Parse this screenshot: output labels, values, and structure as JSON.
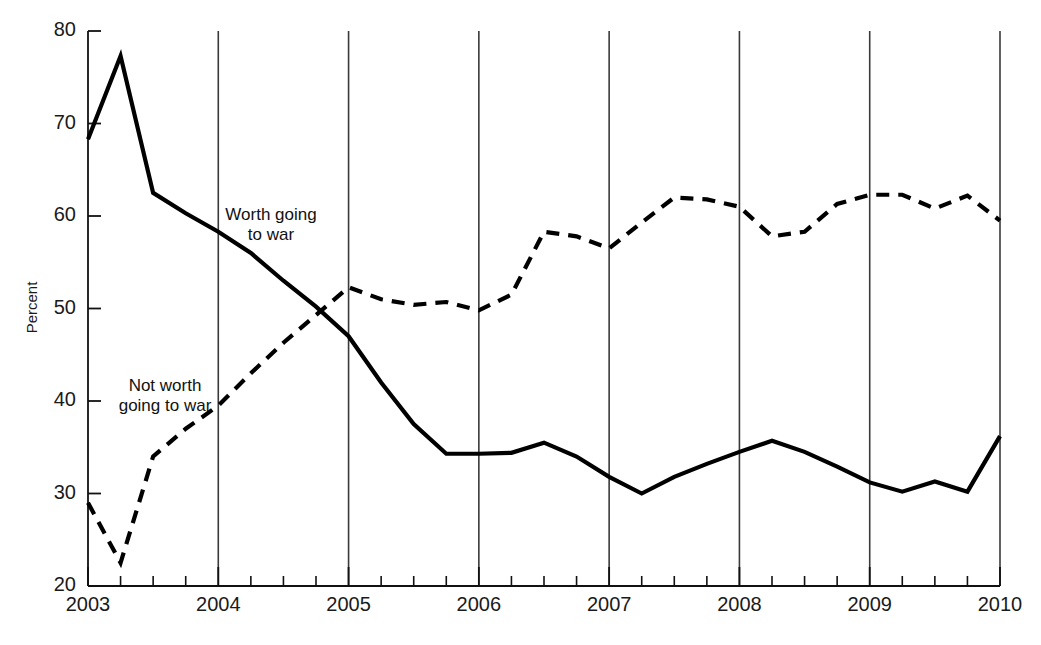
{
  "chart_data": {
    "type": "line",
    "title": "",
    "subtitle": "",
    "xlabel": "",
    "ylabel": "Percent",
    "ylim": [
      20,
      80
    ],
    "xlim": [
      2003,
      2010
    ],
    "y_ticks": [
      20,
      30,
      40,
      50,
      60,
      70,
      80
    ],
    "x_ticks": [
      2003,
      2004,
      2005,
      2006,
      2007,
      2008,
      2009,
      2010
    ],
    "x_tick_labels": [
      "2003",
      "2004",
      "2005",
      "2006",
      "2007",
      "2008",
      "2009",
      "2010"
    ],
    "y_tick_labels": [
      "20",
      "30",
      "40",
      "50",
      "60",
      "70",
      "80"
    ],
    "x_minor_ticks_per_interval": 4,
    "grid": "vertical-only",
    "legend_position": "inline-annotations",
    "series": [
      {
        "name": "Worth going to war",
        "style": "solid",
        "color": "#000000",
        "line_width": 4.2,
        "x": [
          2003.0,
          2003.25,
          2003.5,
          2003.75,
          2004.0,
          2004.25,
          2004.5,
          2004.75,
          2005.0,
          2005.25,
          2005.5,
          2005.75,
          2006.0,
          2006.25,
          2006.5,
          2006.75,
          2007.0,
          2007.25,
          2007.5,
          2007.75,
          2008.0,
          2008.25,
          2008.5,
          2008.75,
          2009.0,
          2009.25,
          2009.5,
          2009.75,
          2010.0
        ],
        "values": [
          68.3,
          77.3,
          62.5,
          60.3,
          58.3,
          56.0,
          53.0,
          50.2,
          47.0,
          42.0,
          37.5,
          34.3,
          34.3,
          34.4,
          35.5,
          34.0,
          31.8,
          30.0,
          31.8,
          33.2,
          34.5,
          35.7,
          34.5,
          32.9,
          31.2,
          30.2,
          31.3,
          30.2,
          36.2
        ]
      },
      {
        "name": "Not worth going to war",
        "style": "dashed",
        "color": "#000000",
        "line_width": 4.2,
        "x": [
          2003.0,
          2003.25,
          2003.5,
          2003.75,
          2004.0,
          2004.25,
          2004.5,
          2004.75,
          2005.0,
          2005.25,
          2005.5,
          2005.75,
          2006.0,
          2006.25,
          2006.5,
          2006.75,
          2007.0,
          2007.25,
          2007.5,
          2007.75,
          2008.0,
          2008.25,
          2008.5,
          2008.75,
          2009.0,
          2009.25,
          2009.5,
          2009.75,
          2010.0
        ],
        "values": [
          29.0,
          22.5,
          34.0,
          37.0,
          39.5,
          43.0,
          46.3,
          49.3,
          52.3,
          51.0,
          50.4,
          50.7,
          49.8,
          51.5,
          58.3,
          57.8,
          56.5,
          59.3,
          62.0,
          61.8,
          61.0,
          57.8,
          58.3,
          61.3,
          62.3,
          62.3,
          60.8,
          62.2,
          59.5
        ]
      }
    ],
    "annotations": [
      {
        "name": "worth-going-to-war-label",
        "text": "Worth going\nto war",
        "x_px": 271,
        "y_px": 225
      },
      {
        "name": "not-worth-going-to-war-label",
        "text": "Not worth\ngoing to war",
        "x_px": 165,
        "y_px": 396
      }
    ]
  },
  "axis": {
    "y_title": "Percent"
  }
}
